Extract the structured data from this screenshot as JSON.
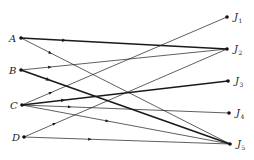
{
  "diagram": {
    "type": "bipartite-directed-graph",
    "colors": {
      "edge": "#1a1a1a",
      "node": "#111111"
    },
    "left_nodes": [
      {
        "id": "A",
        "label": "A"
      },
      {
        "id": "B",
        "label": "B"
      },
      {
        "id": "C",
        "label": "C"
      },
      {
        "id": "D",
        "label": "D"
      }
    ],
    "right_nodes": [
      {
        "id": "J1",
        "label": "J",
        "sub": "1"
      },
      {
        "id": "J2",
        "label": "J",
        "sub": "2"
      },
      {
        "id": "J3",
        "label": "J",
        "sub": "3"
      },
      {
        "id": "J4",
        "label": "J",
        "sub": "4"
      },
      {
        "id": "J5",
        "label": "J",
        "sub": "5"
      }
    ],
    "edges": [
      {
        "from": "A",
        "to": "J2",
        "bold": true
      },
      {
        "from": "A",
        "to": "J5",
        "bold": false
      },
      {
        "from": "B",
        "to": "J2",
        "bold": false
      },
      {
        "from": "B",
        "to": "J5",
        "bold": true
      },
      {
        "from": "C",
        "to": "J1",
        "bold": false
      },
      {
        "from": "C",
        "to": "J3",
        "bold": true
      },
      {
        "from": "C",
        "to": "J4",
        "bold": false
      },
      {
        "from": "C",
        "to": "J5",
        "bold": false
      },
      {
        "from": "D",
        "to": "J2",
        "bold": false
      },
      {
        "from": "D",
        "to": "J5",
        "bold": false
      }
    ]
  }
}
